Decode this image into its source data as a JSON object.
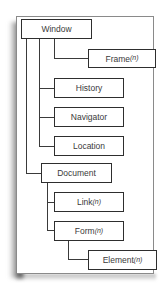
{
  "diagram": {
    "type": "object-hierarchy",
    "nodes": [
      {
        "id": "window",
        "label": "Window",
        "multiplicity": null,
        "parent": null
      },
      {
        "id": "frame",
        "label": "Frame",
        "multiplicity": "(n)",
        "parent": "window"
      },
      {
        "id": "history",
        "label": "History",
        "multiplicity": null,
        "parent": "window"
      },
      {
        "id": "navigator",
        "label": "Navigator",
        "multiplicity": null,
        "parent": "window"
      },
      {
        "id": "location",
        "label": "Location",
        "multiplicity": null,
        "parent": "window"
      },
      {
        "id": "document",
        "label": "Document",
        "multiplicity": null,
        "parent": "window"
      },
      {
        "id": "link",
        "label": "Link",
        "multiplicity": "(n)",
        "parent": "document"
      },
      {
        "id": "form",
        "label": "Form",
        "multiplicity": "(n)",
        "parent": "document"
      },
      {
        "id": "element",
        "label": "Element",
        "multiplicity": "(n)",
        "parent": "form"
      }
    ],
    "colors": {
      "box_border": "#2e2e2e",
      "connector": "#3a3a3a",
      "text": "#3a3a3a",
      "panel_border": "#8a8a8a",
      "background": "#ffffff"
    }
  }
}
